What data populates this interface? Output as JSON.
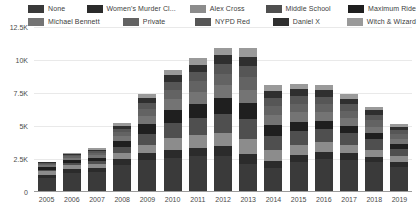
{
  "chart_data": {
    "type": "bar",
    "stacked": true,
    "title": "",
    "subtitle": "",
    "xlabel": "",
    "ylabel": "",
    "grid": true,
    "legend_position": "top",
    "ylim": [
      0,
      12500
    ],
    "ytick_labels": [
      "0",
      "2.5K",
      "5K",
      "7.5K",
      "10K",
      "12.5K"
    ],
    "ytick_values": [
      0,
      2500,
      5000,
      7500,
      10000,
      12500
    ],
    "categories": [
      "2005",
      "2006",
      "2007",
      "2008",
      "2009",
      "2010",
      "2011",
      "2012",
      "2013",
      "2014",
      "2015",
      "2016",
      "2017",
      "2018",
      "2019"
    ],
    "series": [
      {
        "name": "None",
        "color": "#3a3a3a",
        "values": [
          1050,
          1450,
          1500,
          2050,
          2400,
          2600,
          2700,
          2750,
          2150,
          1850,
          2300,
          2500,
          2400,
          2250,
          1900
        ]
      },
      {
        "name": "Women's Murder Cl...",
        "color": "#2b2b2b",
        "values": [
          220,
          260,
          300,
          420,
          520,
          600,
          620,
          700,
          760,
          480,
          520,
          560,
          520,
          430,
          380
        ]
      },
      {
        "name": "Alex Cross",
        "color": "#8c8c8c",
        "values": [
          300,
          330,
          360,
          520,
          680,
          900,
          980,
          1050,
          1100,
          820,
          760,
          700,
          620,
          540,
          450
        ]
      },
      {
        "name": "Middle School",
        "color": "#4f4f4f",
        "values": [
          120,
          150,
          180,
          400,
          820,
          1150,
          1300,
          1450,
          1500,
          1100,
          1050,
          1000,
          900,
          760,
          520
        ]
      },
      {
        "name": "Maximum Ride",
        "color": "#1f1f1f",
        "values": [
          180,
          210,
          260,
          480,
          760,
          980,
          1080,
          1150,
          1200,
          820,
          700,
          640,
          560,
          470,
          360
        ]
      },
      {
        "name": "Michael Bennett",
        "color": "#747474",
        "values": [
          160,
          190,
          230,
          400,
          620,
          820,
          900,
          980,
          1050,
          760,
          720,
          680,
          600,
          510,
          400
        ]
      },
      {
        "name": "Private",
        "color": "#636363",
        "values": [
          90,
          120,
          160,
          300,
          520,
          720,
          820,
          900,
          980,
          700,
          660,
          620,
          560,
          470,
          360
        ]
      },
      {
        "name": "NYPD Red",
        "color": "#565656",
        "values": [
          70,
          90,
          120,
          240,
          420,
          580,
          680,
          760,
          820,
          600,
          580,
          540,
          480,
          400,
          300
        ]
      },
      {
        "name": "Daniel X",
        "color": "#2f2f2f",
        "values": [
          60,
          80,
          110,
          210,
          360,
          500,
          580,
          650,
          700,
          520,
          490,
          460,
          420,
          350,
          260
        ]
      },
      {
        "name": "Witch & Wizard",
        "color": "#9a9a9a",
        "values": [
          50,
          70,
          90,
          180,
          300,
          430,
          500,
          560,
          620,
          450,
          430,
          400,
          360,
          300,
          230
        ]
      }
    ],
    "totals": [
      2300,
      2950,
      3310,
      5200,
      7400,
      8680,
      10160,
      10950,
      10880,
      8102,
      8210,
      8100,
      7420,
      6480,
      5160
    ]
  },
  "legend": {
    "rows": [
      [
        {
          "label": "None",
          "color": "#3a3a3a"
        },
        {
          "label": "Women's Murder Cl...",
          "color": "#2b2b2b"
        },
        {
          "label": "Alex Cross",
          "color": "#8c8c8c"
        },
        {
          "label": "Middle School",
          "color": "#4f4f4f"
        },
        {
          "label": "Maximum Ride",
          "color": "#1f1f1f"
        }
      ],
      [
        {
          "label": "Michael Bennett",
          "color": "#747474"
        },
        {
          "label": "Private",
          "color": "#636363"
        },
        {
          "label": "NYPD Red",
          "color": "#565656"
        },
        {
          "label": "Daniel X",
          "color": "#2f2f2f"
        },
        {
          "label": "Witch & Wizard",
          "color": "#9a9a9a"
        }
      ]
    ]
  },
  "axis": {
    "y_labels": [
      "12.5K",
      "10K",
      "7.5K",
      "5K",
      "2.5K",
      "0"
    ],
    "x_labels": [
      "2005",
      "2006",
      "2007",
      "2008",
      "2009",
      "2010",
      "2011",
      "2012",
      "2013",
      "2014",
      "2015",
      "2016",
      "2017",
      "2018",
      "2019"
    ]
  },
  "colors": {
    "background": "#ffffff",
    "grid": "#e9e9e9",
    "axis": "#9c9c9c",
    "text": "#4a4a4a"
  }
}
